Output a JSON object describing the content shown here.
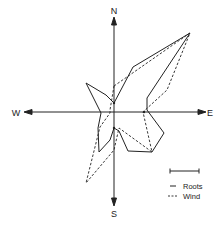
{
  "diagram": {
    "type": "rose diagram",
    "axes": {
      "north": "N",
      "south": "S",
      "west": "W",
      "east": "E"
    },
    "center": [
      114,
      112
    ],
    "legend": {
      "scale_bar": true,
      "items": [
        {
          "label": "Roots",
          "style": "solid"
        },
        {
          "label": "Wind",
          "style": "dashed"
        }
      ]
    },
    "series": [
      {
        "name": "Roots",
        "style": "solid",
        "points": [
          [
            114,
            103
          ],
          [
            133,
            67
          ],
          [
            190,
            33
          ],
          [
            147,
            98
          ],
          [
            147,
            110
          ],
          [
            164,
            133
          ],
          [
            152,
            152
          ],
          [
            128,
            151
          ],
          [
            119,
            131
          ],
          [
            114,
            128
          ],
          [
            110,
            140
          ],
          [
            99,
            152
          ],
          [
            98,
            128
          ],
          [
            101,
            113
          ],
          [
            86,
            83
          ],
          [
            106,
            95
          ]
        ]
      },
      {
        "name": "Wind",
        "style": "dashed",
        "points": [
          [
            114,
            86
          ],
          [
            190,
            33
          ],
          [
            167,
            90
          ],
          [
            143,
            112
          ],
          [
            152,
            152
          ],
          [
            119,
            128
          ],
          [
            114,
            150
          ],
          [
            86,
            183
          ],
          [
            100,
            127
          ],
          [
            110,
            113
          ],
          [
            110,
            110
          ]
        ]
      }
    ],
    "colors": {
      "ink": "#222222",
      "background": "#ffffff"
    }
  }
}
